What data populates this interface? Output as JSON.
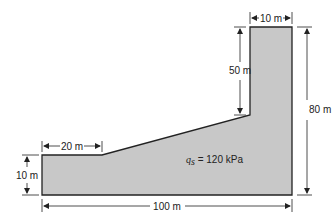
{
  "diagram": {
    "type": "footing-plan",
    "colors": {
      "fill": "#c8c8c8",
      "outline": "#222222",
      "dimension": "#222222",
      "background": "#ffffff"
    },
    "dimensions": {
      "top_width": "10 m",
      "upper_height": "50 m",
      "total_height": "80 m",
      "left_shelf_width": "20 m",
      "left_height": "10 m",
      "total_width": "100 m"
    },
    "load": {
      "symbol": "q",
      "subscript": "s",
      "equals": " = ",
      "value": "120 kPa"
    }
  }
}
